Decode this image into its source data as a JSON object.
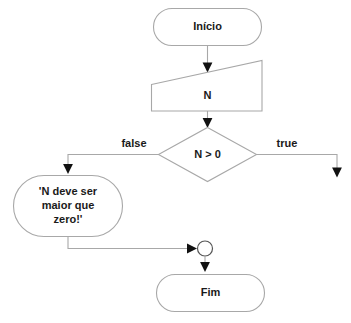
{
  "diagram": {
    "type": "flowchart",
    "language": "pt-BR",
    "background_color": "#ffffff",
    "stroke_color": "#a8a8a8",
    "text_color": "#1a1a1a",
    "arrow_color": "#111111",
    "nodes": [
      {
        "id": "start",
        "shape": "terminator",
        "label": "Início"
      },
      {
        "id": "input-n",
        "shape": "input-trapezoid",
        "label": "N"
      },
      {
        "id": "decision",
        "shape": "diamond",
        "label": "N > 0"
      },
      {
        "id": "message",
        "shape": "output-oval",
        "label_lines": [
          "'N deve ser",
          "maior que",
          "zero!'"
        ]
      },
      {
        "id": "merge",
        "shape": "connector-circle",
        "label": ""
      },
      {
        "id": "end",
        "shape": "terminator",
        "label": "Fim"
      }
    ],
    "branch_labels": {
      "false": "false",
      "true": "true"
    }
  }
}
